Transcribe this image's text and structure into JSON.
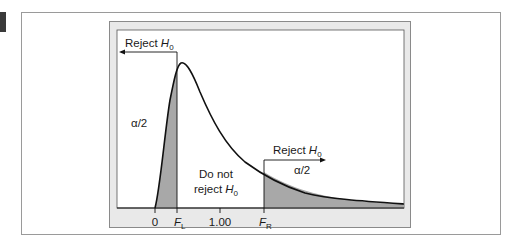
{
  "figure": {
    "type": "F-distribution two-tailed rejection regions",
    "left_region": {
      "label": "Reject",
      "hypothesis": "H",
      "subscript": "0",
      "area_label": "α/2"
    },
    "right_region": {
      "label": "Reject",
      "hypothesis": "H",
      "subscript": "0",
      "area_label": "α/2"
    },
    "middle_region": {
      "line1": "Do not",
      "line2": "reject",
      "hypothesis": "H",
      "subscript": "0"
    },
    "axis_ticks": [
      {
        "label": "0"
      },
      {
        "label": "F",
        "subscript": "L"
      },
      {
        "label": "1.00"
      },
      {
        "label": "F",
        "subscript": "R"
      }
    ],
    "colors": {
      "shade": "#a8a8a8",
      "panel": "#e9e9e9",
      "curve": "#111111"
    }
  }
}
